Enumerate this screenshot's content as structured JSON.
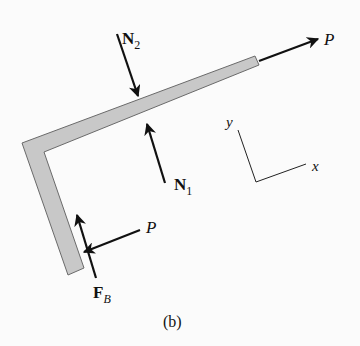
{
  "figure": {
    "caption": "(b)",
    "colors": {
      "background": "#fbfbfb",
      "member_fill": "#c8c8c8",
      "member_stroke": "#6a6a6a",
      "ink": "#111111"
    },
    "labels": {
      "N2_main": "N",
      "N2_sub": "2",
      "N1_main": "N",
      "N1_sub": "1",
      "P_top": "P",
      "P_bottom": "P",
      "FB_main": "F",
      "FB_sub": "B",
      "axis_x": "x",
      "axis_y": "y"
    },
    "forces": [
      {
        "name": "N2",
        "direction": "down-right onto top of bar"
      },
      {
        "name": "N1",
        "direction": "up-left onto bottom of bar"
      },
      {
        "name": "P",
        "location": "right end of upper arm",
        "direction": "along arm, outward"
      },
      {
        "name": "P",
        "location": "lower end of vertical arm",
        "direction": "leftward onto arm"
      },
      {
        "name": "F_B",
        "location": "lower end of vertical arm",
        "direction": "upward along arm"
      }
    ]
  }
}
